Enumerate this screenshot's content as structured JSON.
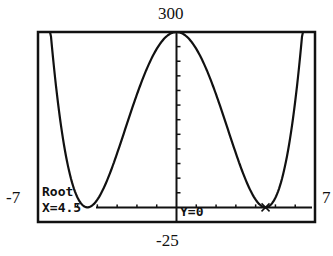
{
  "window": {
    "xmin": "-7",
    "xmax": "7",
    "ymin": "-25",
    "ymax": "300"
  },
  "trace": {
    "mode_label": "Root",
    "x_readout": "X=4.5",
    "y_readout": "Y=0"
  },
  "chart_data": {
    "type": "line",
    "title": "",
    "xlabel": "",
    "ylabel": "",
    "xlim": [
      -7,
      7
    ],
    "ylim": [
      -25,
      300
    ],
    "grid": false,
    "series": [
      {
        "name": "Y1",
        "description": "quartic with double roots at x=-4.5 and x=4.5, maximum 300 at x=0",
        "x": [
          -7,
          -6,
          -5,
          -4.5,
          -4,
          -3,
          -2,
          -1,
          0,
          1,
          2,
          3,
          4,
          4.5,
          5,
          6,
          7
        ],
        "y": [
          1085,
          233,
          11,
          0,
          9,
          94,
          189,
          267,
          300,
          267,
          189,
          94,
          9,
          0,
          11,
          233,
          1085
        ]
      }
    ],
    "annotations": [
      "Root",
      "X=4.5",
      "Y=0"
    ]
  }
}
